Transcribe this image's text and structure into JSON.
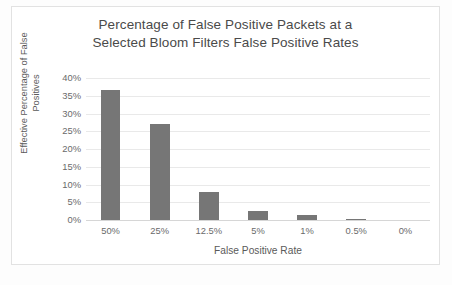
{
  "chart_data": {
    "type": "bar",
    "title": "Percentage of False Positive Packets at a Selected Bloom Filters False Positive Rates",
    "title_lines": [
      "Percentage of False Positive Packets at a",
      "Selected Bloom Filters False Positive Rates"
    ],
    "xlabel": "False Positive Rate",
    "ylabel": "Effective Percentage of False Positives",
    "ylabel_lines": [
      "Effective Percentage of False",
      "Positives"
    ],
    "categories": [
      "50%",
      "25%",
      "12.5%",
      "5%",
      "1%",
      "0.5%",
      "0%"
    ],
    "values": [
      36.5,
      27.0,
      8.0,
      2.5,
      1.4,
      0.3,
      0
    ],
    "ylim": [
      0,
      40
    ],
    "ytick_values": [
      40,
      35,
      30,
      25,
      20,
      15,
      10,
      5,
      0
    ],
    "ytick_labels": [
      "40%",
      "35%",
      "30%",
      "25%",
      "20%",
      "15%",
      "10%",
      "5%",
      "0%"
    ],
    "grid": true,
    "legend": false,
    "series": [
      {
        "name": "Effective Percentage of False Positives",
        "values": [
          36.5,
          27.0,
          8.0,
          2.5,
          1.4,
          0.3,
          0
        ]
      }
    ],
    "colors": {
      "bar": "#767676",
      "gridline": "#e9e9e9",
      "axis": "#d6d6d6",
      "title_text": "#4a4a4a",
      "tick_text": "#6a6a6a",
      "plot_background": "#ffffff",
      "frame_border": "#e2e2e2"
    }
  }
}
